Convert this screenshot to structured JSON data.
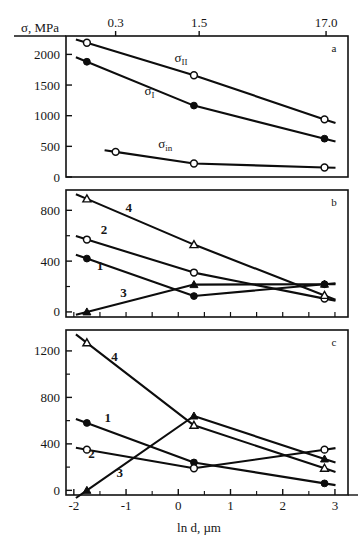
{
  "figure": {
    "axis_title_y": "σ, MPa",
    "axis_title_x": "ln d, µm",
    "panels": [
      "a",
      "b",
      "c"
    ]
  },
  "top_axis": {
    "label_values": [
      "0.3",
      "1.5",
      "17.0"
    ],
    "positions_lnd": [
      -1.2,
      0.4,
      2.83
    ]
  },
  "panel_a": {
    "letter": "a",
    "yticks": [
      "0",
      "500",
      "1000",
      "1500",
      "2000"
    ],
    "ylim": [
      0,
      2300
    ],
    "series_labels": [
      "σII",
      "σI",
      "σin"
    ]
  },
  "panel_b": {
    "letter": "b",
    "yticks": [
      "0",
      "400",
      "800"
    ],
    "ylim": [
      -40,
      960
    ],
    "curve_labels": [
      "1",
      "2",
      "3",
      "4"
    ]
  },
  "panel_c": {
    "letter": "c",
    "yticks": [
      "0",
      "400",
      "800",
      "1200"
    ],
    "ylim": [
      -40,
      1380
    ],
    "curve_labels": [
      "1",
      "2",
      "3",
      "4"
    ]
  },
  "x_axis": {
    "ticks": [
      "-2",
      "-1",
      "0",
      "1",
      "2",
      "3"
    ],
    "xlim": [
      -2.15,
      3.25
    ]
  },
  "chart_data": [
    {
      "type": "line",
      "panel": "a",
      "title": "",
      "xlabel": "ln d, µm",
      "ylabel": "σ, MPa",
      "xlim": [
        -2.15,
        3.25
      ],
      "ylim": [
        0,
        2300
      ],
      "grid": false,
      "legend": "inline-labels",
      "x": [
        -1.75,
        0.3,
        2.8
      ],
      "series": [
        {
          "name": "σII",
          "marker": "open-circle",
          "values": [
            2190,
            1660,
            940
          ]
        },
        {
          "name": "σI",
          "marker": "filled-circle",
          "values": [
            1880,
            1165,
            625
          ]
        },
        {
          "name": "σin",
          "marker": "open-circle",
          "values": [
            410,
            220,
            155
          ]
        }
      ],
      "note": "leftmost point of σin is at x = -1.2"
    },
    {
      "type": "line",
      "panel": "b",
      "title": "",
      "xlabel": "ln d, µm",
      "ylabel": "σ, MPa",
      "xlim": [
        -2.15,
        3.25
      ],
      "ylim": [
        -40,
        960
      ],
      "grid": false,
      "legend": "inline-numbers",
      "x": [
        -1.75,
        0.3,
        2.8
      ],
      "series": [
        {
          "name": "1",
          "marker": "filled-circle",
          "values": [
            420,
            125,
            218
          ]
        },
        {
          "name": "2",
          "marker": "open-circle",
          "values": [
            570,
            310,
            105
          ]
        },
        {
          "name": "3",
          "marker": "filled-triangle",
          "values": [
            0,
            215,
            218
          ]
        },
        {
          "name": "4",
          "marker": "open-triangle",
          "values": [
            890,
            530,
            130
          ]
        }
      ]
    },
    {
      "type": "line",
      "panel": "c",
      "title": "",
      "xlabel": "ln d, µm",
      "ylabel": "σ, MPa",
      "xlim": [
        -2.15,
        3.25
      ],
      "ylim": [
        -40,
        1380
      ],
      "grid": false,
      "legend": "inline-numbers",
      "x": [
        -1.75,
        0.3,
        2.8
      ],
      "series": [
        {
          "name": "1",
          "marker": "filled-circle",
          "values": [
            580,
            240,
            60
          ]
        },
        {
          "name": "2",
          "marker": "open-circle",
          "values": [
            350,
            190,
            350
          ]
        },
        {
          "name": "3",
          "marker": "filled-triangle",
          "values": [
            0,
            640,
            270
          ]
        },
        {
          "name": "4",
          "marker": "open-triangle",
          "values": [
            1270,
            560,
            190
          ]
        }
      ]
    }
  ]
}
